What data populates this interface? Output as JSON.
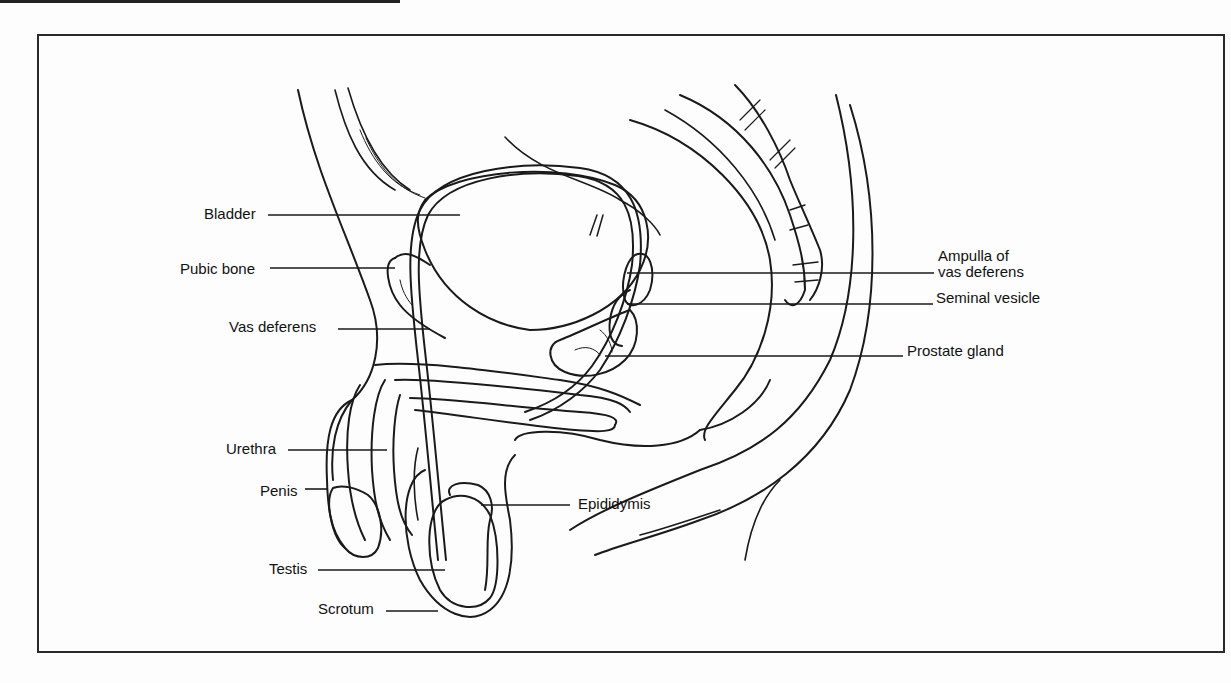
{
  "figure": {
    "title": "",
    "labels_left": [
      {
        "id": "bladder",
        "text": "Bladder",
        "x": 204,
        "y": 206,
        "line": [
          268,
          215,
          460,
          215
        ]
      },
      {
        "id": "pubic-bone",
        "text": "Pubic bone",
        "x": 180,
        "y": 261,
        "line": [
          270,
          268,
          395,
          268
        ]
      },
      {
        "id": "vas-deferens",
        "text": "Vas deferens",
        "x": 229,
        "y": 319,
        "line": [
          338,
          329,
          430,
          329
        ]
      },
      {
        "id": "urethra",
        "text": "Urethra",
        "x": 226,
        "y": 441,
        "line": [
          288,
          450,
          387,
          450
        ]
      },
      {
        "id": "penis",
        "text": "Penis",
        "x": 260,
        "y": 483,
        "line": [
          305,
          489,
          328,
          489
        ]
      },
      {
        "id": "testis",
        "text": "Testis",
        "x": 269,
        "y": 561,
        "line": [
          318,
          570,
          445,
          570
        ]
      },
      {
        "id": "scrotum",
        "text": "Scrotum",
        "x": 318,
        "y": 601,
        "line": [
          386,
          611,
          438,
          611
        ]
      }
    ],
    "labels_right": [
      {
        "id": "ampulla",
        "text": "Ampulla of",
        "text2": "vas deferens",
        "x": 938,
        "y": 248,
        "line": [
          627,
          273,
          934,
          273
        ]
      },
      {
        "id": "seminal-vesicle",
        "text": "Seminal vesicle",
        "x": 936,
        "y": 290,
        "line": [
          627,
          304,
          933,
          304
        ]
      },
      {
        "id": "prostate-gland",
        "text": "Prostate gland",
        "x": 907,
        "y": 343,
        "line": [
          605,
          356,
          903,
          356
        ]
      },
      {
        "id": "epididymis",
        "text": "Epididymis",
        "x": 578,
        "y": 496,
        "line": [
          481,
          505,
          570,
          505
        ]
      }
    ]
  },
  "colors": {
    "ink": "#1a1a1a",
    "background": "#fdfdfd"
  }
}
